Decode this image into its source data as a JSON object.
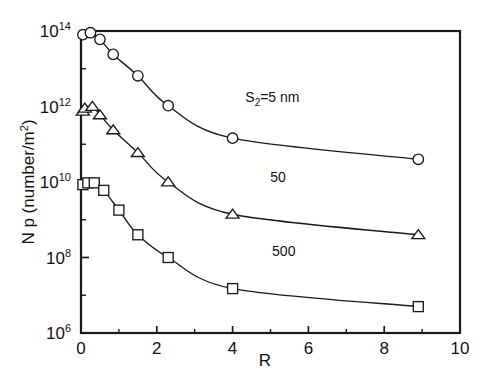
{
  "chart_data": {
    "type": "line",
    "title": "",
    "xlabel": "R",
    "ylabel": "N p (number/m²)",
    "xlim": [
      0,
      10
    ],
    "ylim": [
      1000000.0,
      100000000000000.0
    ],
    "yscale": "log",
    "grid": false,
    "legend_position": "inline-annotations",
    "xticks": [
      0,
      2,
      4,
      6,
      8,
      10
    ],
    "xtick_labels": [
      "0",
      "2",
      "4",
      "6",
      "8",
      "10"
    ],
    "yticks": [
      1000000.0,
      100000000.0,
      10000000000.0,
      1000000000000.0,
      100000000000000.0
    ],
    "ytick_labels": [
      "10⁶",
      "10⁸",
      "10¹⁰",
      "10¹²",
      "10¹⁴"
    ],
    "ytick_mantissa": "10",
    "ytick_exponents": [
      "6",
      "8",
      "10",
      "12",
      "14"
    ],
    "series": [
      {
        "name": "S2=5nm",
        "label": "S₂=5 nm",
        "marker": "circle",
        "label_x": 5.05,
        "label_y": 1300000000000.0,
        "x": [
          0.05,
          0.25,
          0.5,
          0.85,
          1.5,
          2.3,
          4.0,
          8.9
        ],
        "y": [
          80000000000000.0,
          90000000000000.0,
          60000000000000.0,
          24000000000000.0,
          6500000000000.0,
          1050000000000.0,
          145000000000.0,
          40000000000.0
        ]
      },
      {
        "name": "S2=50nm",
        "label": "50",
        "marker": "triangle",
        "label_x": 5.2,
        "label_y": 10000000000.0,
        "x": [
          0.05,
          0.1,
          0.3,
          0.5,
          0.85,
          1.5,
          2.3,
          4.0,
          8.9
        ],
        "y": [
          750000000000.0,
          900000000000.0,
          1000000000000.0,
          600000000000.0,
          240000000000.0,
          60000000000.0,
          10000000000.0,
          1400000000.0,
          400000000.0
        ]
      },
      {
        "name": "S2=500nm",
        "label": "500",
        "marker": "square",
        "label_x": 5.35,
        "label_y": 110000000.0,
        "x": [
          0.05,
          0.18,
          0.35,
          0.6,
          1.0,
          1.5,
          2.3,
          4.0,
          8.9
        ],
        "y": [
          8500000000.0,
          9500000000.0,
          9500000000.0,
          6000000000.0,
          1800000000.0,
          400000000.0,
          100000000.0,
          15000000.0,
          5000000.0
        ]
      }
    ]
  },
  "figure": {
    "xlabel_text": "R",
    "ylabel_text": "N p (number/m²)",
    "ylabel_parts": {
      "prefix": "N p (number/m",
      "sup": "2",
      "suffix": ")"
    }
  }
}
